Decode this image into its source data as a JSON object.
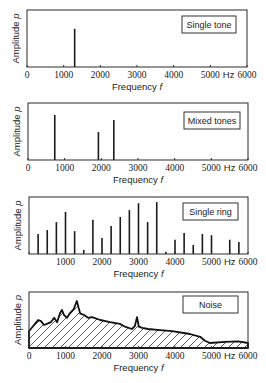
{
  "chart_data": [
    {
      "type": "bar",
      "title": "Single tone",
      "xlabel": "Frequency f",
      "ylabel": "Amplitude p",
      "x_unit": "Hz",
      "xlim": [
        0,
        6000
      ],
      "x_ticks": [
        "0",
        "1000",
        "2000",
        "3000",
        "4000",
        "5000",
        "6000"
      ],
      "grid": false,
      "legend_position": "top-right box",
      "x": [
        1300
      ],
      "values": [
        0.67
      ]
    },
    {
      "type": "bar",
      "title": "Mixed tones",
      "xlabel": "Frequency f",
      "ylabel": "Amplitude p",
      "x_unit": "Hz",
      "xlim": [
        0,
        6000
      ],
      "x_ticks": [
        "0",
        "1000",
        "2000",
        "3000",
        "4000",
        "5000",
        "6000"
      ],
      "grid": false,
      "legend_position": "top-right box",
      "x": [
        730,
        1920,
        2340
      ],
      "values": [
        0.79,
        0.49,
        0.7
      ]
    },
    {
      "type": "bar",
      "title": "Single ring",
      "xlabel": "Frequency f",
      "ylabel": "Amplitude p",
      "x_unit": "Hz",
      "xlim": [
        0,
        6000
      ],
      "x_ticks": [
        "1000",
        "2000",
        "3000",
        "4000",
        "5000",
        "6000"
      ],
      "grid": false,
      "legend_position": "top-right box",
      "x": [
        250,
        500,
        750,
        1000,
        1250,
        1500,
        1750,
        2000,
        2250,
        2500,
        2750,
        3000,
        3250,
        3500,
        3750,
        4000,
        4250,
        4500,
        4750,
        5000,
        5500,
        5750
      ],
      "values": [
        0.35,
        0.42,
        0.56,
        0.74,
        0.4,
        0.07,
        0.6,
        0.28,
        0.49,
        0.65,
        0.77,
        0.89,
        0.56,
        0.91,
        0.04,
        0.25,
        0.37,
        0.16,
        0.35,
        0.33,
        0.25,
        0.21
      ]
    },
    {
      "type": "area",
      "title": "Noise",
      "xlabel": "Frequency f",
      "ylabel": "Amplitude p",
      "x_unit": "Hz",
      "xlim": [
        0,
        6000
      ],
      "x_ticks": [
        "0",
        "1000",
        "2000",
        "3000",
        "4000",
        "5000",
        "6000"
      ],
      "grid": false,
      "fill": "diagonal hatch",
      "legend_position": "top-right box",
      "x": [
        0,
        110,
        250,
        330,
        410,
        490,
        600,
        690,
        770,
        850,
        900,
        960,
        1040,
        1120,
        1230,
        1310,
        1400,
        1510,
        1620,
        1730,
        1950,
        2220,
        2490,
        2630,
        2820,
        2900,
        2960,
        3010,
        3100,
        3260,
        3590,
        3920,
        4410,
        4690,
        4820,
        4960,
        5370,
        5730,
        6000
      ],
      "values": [
        0.3,
        0.39,
        0.5,
        0.48,
        0.41,
        0.43,
        0.46,
        0.54,
        0.46,
        0.62,
        0.68,
        0.59,
        0.54,
        0.62,
        0.7,
        0.84,
        0.62,
        0.59,
        0.54,
        0.55,
        0.5,
        0.46,
        0.43,
        0.38,
        0.34,
        0.39,
        0.55,
        0.38,
        0.36,
        0.34,
        0.32,
        0.3,
        0.25,
        0.2,
        0.13,
        0.09,
        0.11,
        0.12,
        0.09
      ]
    }
  ],
  "labels": {
    "ylabel": "Amplitude",
    "ylabel_sym": "p",
    "xlabel": "Frequency",
    "xlabel_sym": "f",
    "hz": "Hz",
    "ticks": [
      "0",
      "1000",
      "2000",
      "3000",
      "4000",
      "5000",
      "6000"
    ],
    "panel_titles": [
      "Single tone",
      "Mixed tones",
      "Single ring",
      "Noise"
    ]
  }
}
